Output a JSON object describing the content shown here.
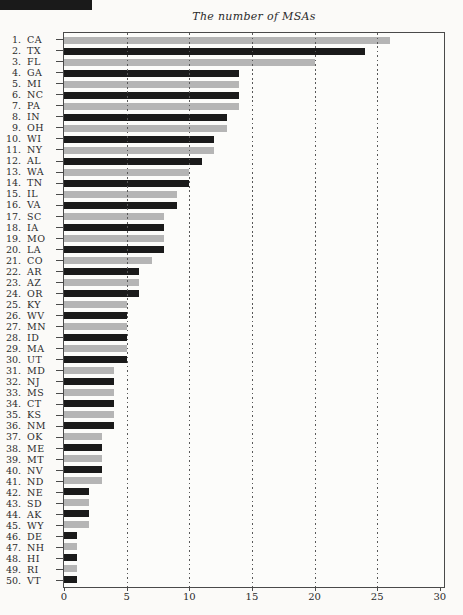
{
  "page": {
    "header_fragment_color": "#1a1a1a"
  },
  "chart_data": {
    "type": "bar",
    "orientation": "horizontal",
    "title": "The number of MSAs",
    "rank_labels": [
      "1.",
      "2.",
      "3.",
      "4.",
      "5.",
      "6.",
      "7.",
      "8.",
      "9.",
      "10.",
      "11.",
      "12.",
      "13.",
      "14.",
      "15.",
      "16.",
      "17.",
      "18.",
      "19.",
      "20.",
      "21.",
      "22.",
      "23.",
      "24.",
      "25.",
      "26.",
      "27.",
      "28.",
      "29.",
      "30.",
      "31.",
      "32.",
      "33.",
      "34.",
      "35.",
      "36.",
      "37.",
      "38.",
      "39.",
      "40.",
      "41.",
      "42.",
      "43.",
      "44.",
      "45.",
      "46.",
      "47.",
      "48.",
      "49.",
      "50."
    ],
    "categories": [
      "CA",
      "TX",
      "FL",
      "GA",
      "MI",
      "NC",
      "PA",
      "IN",
      "OH",
      "WI",
      "NY",
      "AL",
      "WA",
      "TN",
      "IL",
      "VA",
      "SC",
      "IA",
      "MO",
      "LA",
      "CO",
      "AR",
      "AZ",
      "OR",
      "KY",
      "WV",
      "MN",
      "ID",
      "MA",
      "UT",
      "MD",
      "NJ",
      "MS",
      "CT",
      "KS",
      "NM",
      "OK",
      "ME",
      "MT",
      "NV",
      "ND",
      "NE",
      "SD",
      "AK",
      "WY",
      "DE",
      "NH",
      "HI",
      "RI",
      "VT"
    ],
    "values": [
      26,
      24,
      20,
      14,
      14,
      14,
      14,
      13,
      13,
      12,
      12,
      11,
      10,
      10,
      9,
      9,
      8,
      8,
      8,
      8,
      7,
      6,
      6,
      6,
      5,
      5,
      5,
      5,
      5,
      5,
      4,
      4,
      4,
      4,
      4,
      4,
      3,
      3,
      3,
      3,
      3,
      2,
      2,
      2,
      2,
      1,
      1,
      1,
      1,
      1
    ],
    "bar_color_odd_rank": "#b5b5b5",
    "bar_color_even_rank": "#1a1a1a",
    "xlabel": "",
    "ylabel": "",
    "xticks": [
      0,
      5,
      10,
      15,
      20,
      25,
      30
    ],
    "xtick_labels": [
      "0",
      "5",
      "10",
      "15",
      "20",
      "25",
      "30"
    ],
    "gridlines": [
      5,
      10,
      15,
      20,
      25
    ],
    "grid": "dotted-vertical-over-bars",
    "xlim": [
      0,
      30.33
    ],
    "legend": "none",
    "axis_color": "#4a4a4a",
    "grid_color": "#585858",
    "text_color": "#2b2b2b"
  }
}
